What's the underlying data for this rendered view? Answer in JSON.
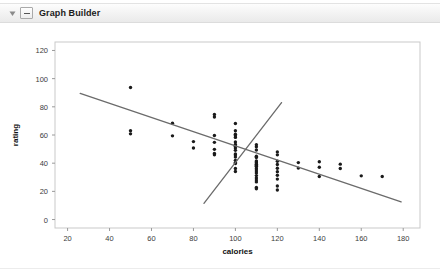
{
  "titlebar": {
    "title": "Graph Builder",
    "disclosure_icon": "triangle-down-icon",
    "outline_icon": "outline-collapse-icon"
  },
  "chart_data": {
    "type": "scatter",
    "title": "",
    "xlabel": "calories",
    "ylabel": "rating",
    "xlim": [
      14,
      188
    ],
    "ylim": [
      -6,
      126
    ],
    "xticks": [
      20,
      40,
      60,
      80,
      100,
      120,
      140,
      160,
      180
    ],
    "yticks": [
      0,
      20,
      40,
      60,
      80,
      100,
      120
    ],
    "grid": false,
    "legend": "none",
    "point_color": "#1a1a1a",
    "line_color": "#6b6b6b",
    "points": [
      [
        50,
        93.7
      ],
      [
        50,
        63.0
      ],
      [
        50,
        60.8
      ],
      [
        70,
        68.4
      ],
      [
        70,
        59.4
      ],
      [
        80,
        55.3
      ],
      [
        80,
        50.8
      ],
      [
        90,
        72.8
      ],
      [
        90,
        74.5
      ],
      [
        90,
        59.6
      ],
      [
        90,
        54.8
      ],
      [
        90,
        49.8
      ],
      [
        90,
        46.9
      ],
      [
        90,
        45.9
      ],
      [
        100,
        68.2
      ],
      [
        100,
        63.0
      ],
      [
        100,
        60.5
      ],
      [
        100,
        59.4
      ],
      [
        100,
        58.3
      ],
      [
        100,
        55.0
      ],
      [
        100,
        53.3
      ],
      [
        100,
        52.0
      ],
      [
        100,
        50.8
      ],
      [
        100,
        49.1
      ],
      [
        100,
        46.6
      ],
      [
        100,
        45.8
      ],
      [
        100,
        44.3
      ],
      [
        100,
        42.0
      ],
      [
        100,
        40.4
      ],
      [
        100,
        39.7
      ],
      [
        100,
        36.2
      ],
      [
        100,
        34.1
      ],
      [
        110,
        53.1
      ],
      [
        110,
        51.6
      ],
      [
        110,
        49.4
      ],
      [
        110,
        45.0
      ],
      [
        110,
        44.0
      ],
      [
        110,
        41.5
      ],
      [
        110,
        40.9
      ],
      [
        110,
        40.1
      ],
      [
        110,
        39.2
      ],
      [
        110,
        38.4
      ],
      [
        110,
        37.8
      ],
      [
        110,
        36.5
      ],
      [
        110,
        35.8
      ],
      [
        110,
        34.4
      ],
      [
        110,
        33.1
      ],
      [
        110,
        31.2
      ],
      [
        110,
        29.5
      ],
      [
        110,
        28.0
      ],
      [
        110,
        26.7
      ],
      [
        110,
        22.7
      ],
      [
        110,
        21.9
      ],
      [
        120,
        48.0
      ],
      [
        120,
        45.9
      ],
      [
        120,
        41.4
      ],
      [
        120,
        39.1
      ],
      [
        120,
        36.4
      ],
      [
        120,
        34.0
      ],
      [
        120,
        31.4
      ],
      [
        120,
        28.7
      ],
      [
        120,
        23.8
      ],
      [
        120,
        21.0
      ],
      [
        130,
        40.4
      ],
      [
        130,
        36.5
      ],
      [
        140,
        41.0
      ],
      [
        140,
        37.1
      ],
      [
        140,
        30.5
      ],
      [
        150,
        39.3
      ],
      [
        150,
        36.2
      ],
      [
        160,
        31.0
      ],
      [
        170,
        30.5
      ]
    ],
    "fit_lines": [
      {
        "name": "overall-regression-line",
        "x1": 26,
        "y1": 89.5,
        "x2": 179,
        "y2": 12.5
      },
      {
        "name": "subgroup-regression-line",
        "x1": 85,
        "y1": 11.5,
        "x2": 122,
        "y2": 83.0
      }
    ]
  }
}
